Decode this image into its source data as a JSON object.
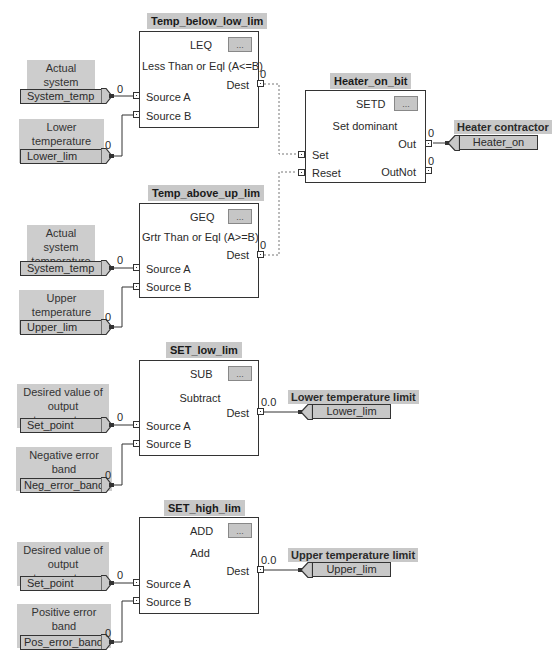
{
  "diagram": {
    "blocks": [
      {
        "name": "Temp_below_low_lim",
        "opcode": "LEQ",
        "description": "Less Than or Eql (A<=B)",
        "ellipsis": "...",
        "inputs": [
          "Source A",
          "Source B"
        ],
        "outputs": [
          "Dest"
        ],
        "output_values": [
          "0"
        ]
      },
      {
        "name": "Heater_on_bit",
        "opcode": "SETD",
        "description": "Set dominant",
        "ellipsis": "...",
        "inputs": [
          "Set",
          "Reset"
        ],
        "outputs": [
          "Out",
          "OutNot"
        ],
        "output_values": [
          "0",
          "0"
        ]
      },
      {
        "name": "Temp_above_up_lim",
        "opcode": "GEQ",
        "description": "Grtr Than or Eql (A>=B)",
        "ellipsis": "...",
        "inputs": [
          "Source A",
          "Source B"
        ],
        "outputs": [
          "Dest"
        ],
        "output_values": [
          "0"
        ]
      },
      {
        "name": "SET_low_lim",
        "opcode": "SUB",
        "description": "Subtract",
        "ellipsis": "...",
        "inputs": [
          "Source A",
          "Source B"
        ],
        "outputs": [
          "Dest"
        ],
        "output_values": [
          "0.0"
        ]
      },
      {
        "name": "SET_high_lim",
        "opcode": "ADD",
        "description": "Add",
        "ellipsis": "...",
        "inputs": [
          "Source A",
          "Source B"
        ],
        "outputs": [
          "Dest"
        ],
        "output_values": [
          "0.0"
        ]
      }
    ],
    "input_tags": [
      {
        "comment": [
          "Actual system",
          "temperature"
        ],
        "tag": "System_temp",
        "value": "0"
      },
      {
        "comment": [
          "Lower temperature",
          "limit"
        ],
        "tag": "Lower_lim",
        "value": "0"
      },
      {
        "comment": [
          "Actual system",
          "temperature"
        ],
        "tag": "System_temp",
        "value": "0"
      },
      {
        "comment": [
          "Upper temperature",
          "limit"
        ],
        "tag": "Upper_lim",
        "value": "0"
      },
      {
        "comment": [
          "Desired value of",
          "output temperature"
        ],
        "tag": "Set_point",
        "value": "0"
      },
      {
        "comment": [
          "Negative error band",
          "in degrees"
        ],
        "tag": "Neg_error_band",
        "value": "0"
      },
      {
        "comment": [
          "Desired value of",
          "output temperature"
        ],
        "tag": "Set_point",
        "value": "0"
      },
      {
        "comment": [
          "Positive error band",
          "in degrees"
        ],
        "tag": "Pos_error_band",
        "value": "0"
      }
    ],
    "output_tags": [
      {
        "label": "Heater contractor",
        "tag": "Heater_on"
      },
      {
        "label": "Lower temperature limit",
        "tag": "Lower_lim"
      },
      {
        "label": "Upper temperature limit",
        "tag": "Upper_lim"
      }
    ],
    "colors": {
      "tag_fill": "#c8c8c8",
      "block_border": "#333333",
      "wire": "#333333",
      "dashed_wire": "#777777"
    }
  }
}
